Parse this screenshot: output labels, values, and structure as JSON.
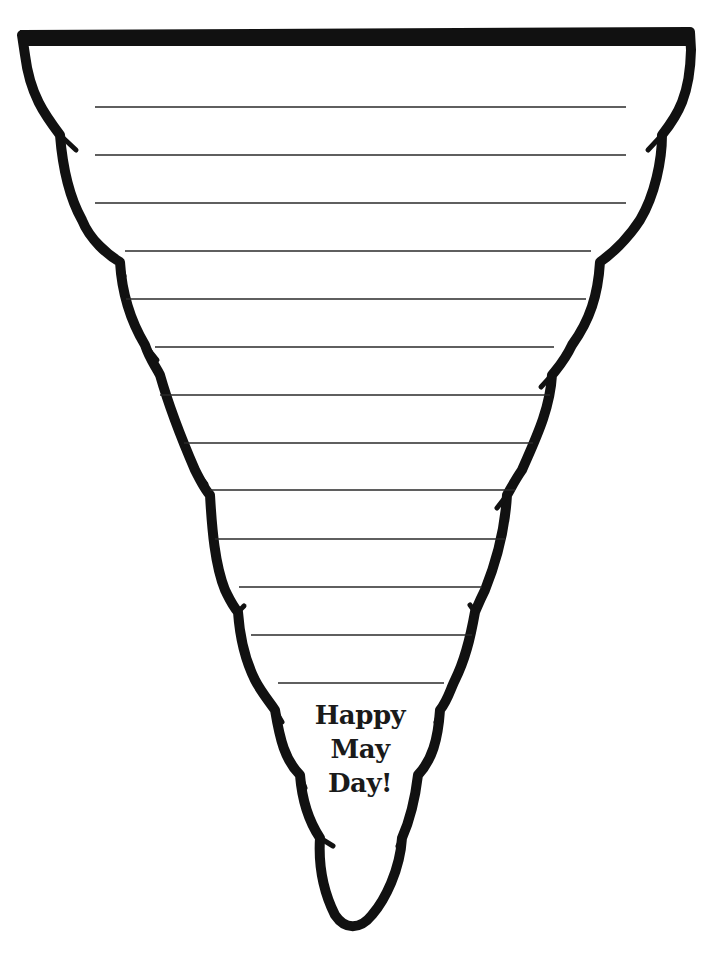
{
  "document": {
    "type": "writing-template",
    "shape": "cone-pennant",
    "colors": {
      "outline": "#111111",
      "rule_lines": "#2a2a2a",
      "background": "#ffffff",
      "text": "#1a1a1a"
    },
    "greeting": {
      "line1": "Happy",
      "line2": "May",
      "line3": "Day!"
    },
    "ruled_lines": [
      {
        "y": 107,
        "x1": 95,
        "x2": 626
      },
      {
        "y": 155,
        "x1": 95,
        "x2": 626
      },
      {
        "y": 203,
        "x1": 95,
        "x2": 626
      },
      {
        "y": 251,
        "x1": 125,
        "x2": 591
      },
      {
        "y": 299,
        "x1": 126,
        "x2": 586
      },
      {
        "y": 347,
        "x1": 155,
        "x2": 554
      },
      {
        "y": 395,
        "x1": 160,
        "x2": 550
      },
      {
        "y": 443,
        "x1": 184,
        "x2": 533
      },
      {
        "y": 490,
        "x1": 210,
        "x2": 515
      },
      {
        "y": 539,
        "x1": 215,
        "x2": 505
      },
      {
        "y": 587,
        "x1": 239,
        "x2": 482
      },
      {
        "y": 635,
        "x1": 251,
        "x2": 472
      },
      {
        "y": 683,
        "x1": 278,
        "x2": 444
      }
    ]
  }
}
